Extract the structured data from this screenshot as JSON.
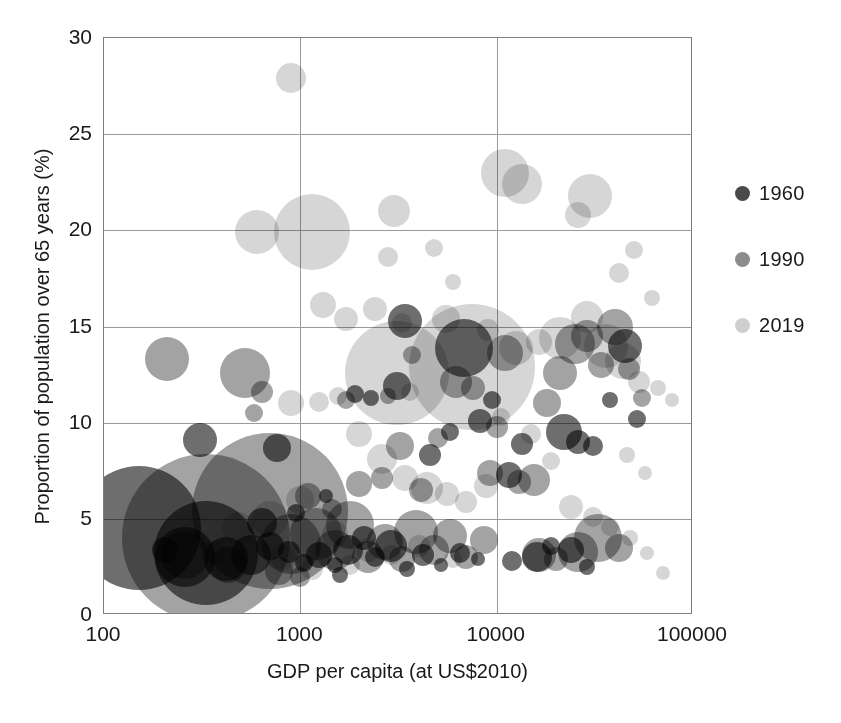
{
  "chart_data": {
    "type": "scatter",
    "title": "",
    "xlabel": "GDP per capita (at US$2010)",
    "ylabel": "Proportion of population over 65 years (%)",
    "xscale": "log",
    "yscale": "linear",
    "xlim": [
      100,
      100000
    ],
    "ylim": [
      0,
      30
    ],
    "xticks": [
      "100",
      "1000",
      "10000",
      "100000"
    ],
    "yticks": [
      "0",
      "5",
      "10",
      "15",
      "20",
      "25",
      "30"
    ],
    "grid": "both",
    "legend_position": "right",
    "legend": [
      {
        "name": "1960",
        "color": "#4a4a4a"
      },
      {
        "name": "1990",
        "color": "#8c8c8c"
      },
      {
        "name": "2019",
        "color": "#cfcfcf"
      }
    ],
    "size_encoding": "population",
    "series": [
      {
        "name": "1960",
        "color": "#4a4a4a",
        "points": [
          {
            "x": 150,
            "y": 4.5,
            "r": 62
          },
          {
            "x": 330,
            "y": 3.2,
            "r": 52
          },
          {
            "x": 260,
            "y": 3.0,
            "r": 30
          },
          {
            "x": 205,
            "y": 3.4,
            "r": 13
          },
          {
            "x": 420,
            "y": 2.9,
            "r": 22
          },
          {
            "x": 310,
            "y": 9.1,
            "r": 17
          },
          {
            "x": 560,
            "y": 3.1,
            "r": 20
          },
          {
            "x": 700,
            "y": 3.6,
            "r": 14
          },
          {
            "x": 880,
            "y": 3.3,
            "r": 11
          },
          {
            "x": 1050,
            "y": 2.7,
            "r": 9
          },
          {
            "x": 1250,
            "y": 3.1,
            "r": 13
          },
          {
            "x": 1500,
            "y": 2.6,
            "r": 8
          },
          {
            "x": 1750,
            "y": 3.4,
            "r": 15
          },
          {
            "x": 2100,
            "y": 4.0,
            "r": 12
          },
          {
            "x": 2400,
            "y": 3.0,
            "r": 10
          },
          {
            "x": 2900,
            "y": 3.6,
            "r": 16
          },
          {
            "x": 3500,
            "y": 2.4,
            "r": 8
          },
          {
            "x": 4200,
            "y": 3.1,
            "r": 11
          },
          {
            "x": 5200,
            "y": 2.6,
            "r": 7
          },
          {
            "x": 6500,
            "y": 3.2,
            "r": 10
          },
          {
            "x": 8000,
            "y": 2.9,
            "r": 7
          },
          {
            "x": 950,
            "y": 5.3,
            "r": 9
          },
          {
            "x": 1350,
            "y": 6.2,
            "r": 7
          },
          {
            "x": 1900,
            "y": 11.5,
            "r": 9
          },
          {
            "x": 2300,
            "y": 11.3,
            "r": 8
          },
          {
            "x": 3100,
            "y": 11.9,
            "r": 14
          },
          {
            "x": 3400,
            "y": 15.3,
            "r": 17
          },
          {
            "x": 4600,
            "y": 8.3,
            "r": 11
          },
          {
            "x": 5800,
            "y": 9.5,
            "r": 9
          },
          {
            "x": 6800,
            "y": 13.9,
            "r": 29
          },
          {
            "x": 8200,
            "y": 10.1,
            "r": 12
          },
          {
            "x": 9500,
            "y": 11.2,
            "r": 9
          },
          {
            "x": 11500,
            "y": 7.3,
            "r": 13
          },
          {
            "x": 13500,
            "y": 8.9,
            "r": 11
          },
          {
            "x": 16000,
            "y": 3.0,
            "r": 15
          },
          {
            "x": 19000,
            "y": 3.6,
            "r": 9
          },
          {
            "x": 22000,
            "y": 9.5,
            "r": 18
          },
          {
            "x": 26000,
            "y": 9.0,
            "r": 12
          },
          {
            "x": 31000,
            "y": 8.8,
            "r": 10
          },
          {
            "x": 38000,
            "y": 11.2,
            "r": 8
          },
          {
            "x": 45000,
            "y": 14.0,
            "r": 17
          },
          {
            "x": 52000,
            "y": 10.2,
            "r": 9
          },
          {
            "x": 760,
            "y": 8.7,
            "r": 14
          },
          {
            "x": 640,
            "y": 4.8,
            "r": 15
          },
          {
            "x": 1600,
            "y": 2.1,
            "r": 8
          },
          {
            "x": 12000,
            "y": 2.8,
            "r": 10
          },
          {
            "x": 24000,
            "y": 3.4,
            "r": 13
          },
          {
            "x": 29000,
            "y": 2.5,
            "r": 8
          }
        ]
      },
      {
        "name": "1990",
        "color": "#8c8c8c",
        "points": [
          {
            "x": 330,
            "y": 4.0,
            "r": 84
          },
          {
            "x": 700,
            "y": 5.4,
            "r": 78
          },
          {
            "x": 210,
            "y": 13.3,
            "r": 22
          },
          {
            "x": 260,
            "y": 3.1,
            "r": 24
          },
          {
            "x": 430,
            "y": 2.6,
            "r": 18
          },
          {
            "x": 520,
            "y": 12.6,
            "r": 25
          },
          {
            "x": 640,
            "y": 11.6,
            "r": 11
          },
          {
            "x": 580,
            "y": 10.5,
            "r": 9
          },
          {
            "x": 900,
            "y": 3.7,
            "r": 30
          },
          {
            "x": 1200,
            "y": 4.2,
            "r": 26
          },
          {
            "x": 1500,
            "y": 3.4,
            "r": 20
          },
          {
            "x": 1800,
            "y": 4.7,
            "r": 24
          },
          {
            "x": 2200,
            "y": 3.0,
            "r": 16
          },
          {
            "x": 2700,
            "y": 3.8,
            "r": 18
          },
          {
            "x": 3300,
            "y": 2.9,
            "r": 13
          },
          {
            "x": 3900,
            "y": 4.3,
            "r": 22
          },
          {
            "x": 4800,
            "y": 3.4,
            "r": 15
          },
          {
            "x": 5800,
            "y": 4.1,
            "r": 17
          },
          {
            "x": 7000,
            "y": 3.0,
            "r": 12
          },
          {
            "x": 8600,
            "y": 3.9,
            "r": 14
          },
          {
            "x": 1100,
            "y": 6.2,
            "r": 13
          },
          {
            "x": 1450,
            "y": 5.5,
            "r": 10
          },
          {
            "x": 2000,
            "y": 6.8,
            "r": 13
          },
          {
            "x": 2600,
            "y": 7.1,
            "r": 11
          },
          {
            "x": 3200,
            "y": 8.8,
            "r": 14
          },
          {
            "x": 4100,
            "y": 6.5,
            "r": 12
          },
          {
            "x": 5000,
            "y": 9.2,
            "r": 10
          },
          {
            "x": 6200,
            "y": 12.1,
            "r": 16
          },
          {
            "x": 7600,
            "y": 11.8,
            "r": 12
          },
          {
            "x": 9200,
            "y": 7.4,
            "r": 13
          },
          {
            "x": 11000,
            "y": 13.6,
            "r": 18
          },
          {
            "x": 13000,
            "y": 6.9,
            "r": 12
          },
          {
            "x": 15500,
            "y": 7.0,
            "r": 16
          },
          {
            "x": 18000,
            "y": 11.0,
            "r": 14
          },
          {
            "x": 21000,
            "y": 12.6,
            "r": 17
          },
          {
            "x": 25000,
            "y": 14.1,
            "r": 20
          },
          {
            "x": 29000,
            "y": 14.5,
            "r": 16
          },
          {
            "x": 34000,
            "y": 13.0,
            "r": 13
          },
          {
            "x": 40000,
            "y": 15.0,
            "r": 18
          },
          {
            "x": 47000,
            "y": 12.8,
            "r": 11
          },
          {
            "x": 55000,
            "y": 11.3,
            "r": 9
          },
          {
            "x": 1700,
            "y": 11.2,
            "r": 9
          },
          {
            "x": 2800,
            "y": 11.4,
            "r": 8
          },
          {
            "x": 780,
            "y": 2.3,
            "r": 14
          },
          {
            "x": 1000,
            "y": 2.0,
            "r": 10
          },
          {
            "x": 16500,
            "y": 3.1,
            "r": 17
          },
          {
            "x": 20000,
            "y": 2.9,
            "r": 12
          },
          {
            "x": 26000,
            "y": 3.3,
            "r": 20
          },
          {
            "x": 33000,
            "y": 4.0,
            "r": 24
          },
          {
            "x": 42000,
            "y": 3.5,
            "r": 14
          },
          {
            "x": 3700,
            "y": 13.5,
            "r": 9
          },
          {
            "x": 10000,
            "y": 9.8,
            "r": 11
          }
        ]
      },
      {
        "name": "2019",
        "color": "#cfcfcf",
        "points": [
          {
            "x": 900,
            "y": 27.9,
            "r": 15
          },
          {
            "x": 600,
            "y": 19.9,
            "r": 22
          },
          {
            "x": 1150,
            "y": 19.9,
            "r": 38
          },
          {
            "x": 3000,
            "y": 21.0,
            "r": 16
          },
          {
            "x": 11000,
            "y": 23.0,
            "r": 24
          },
          {
            "x": 13500,
            "y": 22.4,
            "r": 20
          },
          {
            "x": 30000,
            "y": 21.8,
            "r": 22
          },
          {
            "x": 26000,
            "y": 20.8,
            "r": 13
          },
          {
            "x": 2800,
            "y": 18.6,
            "r": 10
          },
          {
            "x": 4800,
            "y": 19.1,
            "r": 9
          },
          {
            "x": 50000,
            "y": 19.0,
            "r": 9
          },
          {
            "x": 62000,
            "y": 16.5,
            "r": 8
          },
          {
            "x": 42000,
            "y": 17.8,
            "r": 10
          },
          {
            "x": 6000,
            "y": 17.3,
            "r": 8
          },
          {
            "x": 1300,
            "y": 16.1,
            "r": 13
          },
          {
            "x": 1700,
            "y": 15.4,
            "r": 12
          },
          {
            "x": 2400,
            "y": 15.9,
            "r": 12
          },
          {
            "x": 3300,
            "y": 15.2,
            "r": 10
          },
          {
            "x": 5500,
            "y": 15.4,
            "r": 14
          },
          {
            "x": 7500,
            "y": 12.9,
            "r": 63
          },
          {
            "x": 3100,
            "y": 12.6,
            "r": 52
          },
          {
            "x": 9000,
            "y": 14.8,
            "r": 11
          },
          {
            "x": 12500,
            "y": 13.9,
            "r": 17
          },
          {
            "x": 16500,
            "y": 14.2,
            "r": 13
          },
          {
            "x": 21000,
            "y": 14.4,
            "r": 21
          },
          {
            "x": 29000,
            "y": 15.5,
            "r": 16
          },
          {
            "x": 36000,
            "y": 14.0,
            "r": 22
          },
          {
            "x": 44000,
            "y": 13.2,
            "r": 18
          },
          {
            "x": 53000,
            "y": 12.1,
            "r": 11
          },
          {
            "x": 66000,
            "y": 11.8,
            "r": 8
          },
          {
            "x": 78000,
            "y": 11.2,
            "r": 7
          },
          {
            "x": 900,
            "y": 11.0,
            "r": 13
          },
          {
            "x": 1250,
            "y": 11.1,
            "r": 10
          },
          {
            "x": 1550,
            "y": 11.4,
            "r": 9
          },
          {
            "x": 2000,
            "y": 9.4,
            "r": 13
          },
          {
            "x": 2600,
            "y": 8.1,
            "r": 15
          },
          {
            "x": 3400,
            "y": 7.1,
            "r": 13
          },
          {
            "x": 4400,
            "y": 6.6,
            "r": 16
          },
          {
            "x": 5600,
            "y": 6.3,
            "r": 12
          },
          {
            "x": 7000,
            "y": 5.9,
            "r": 11
          },
          {
            "x": 8800,
            "y": 6.7,
            "r": 12
          },
          {
            "x": 1000,
            "y": 6.0,
            "r": 14
          },
          {
            "x": 700,
            "y": 5.0,
            "r": 18
          },
          {
            "x": 480,
            "y": 4.5,
            "r": 16
          },
          {
            "x": 1500,
            "y": 4.2,
            "r": 13
          },
          {
            "x": 2200,
            "y": 3.4,
            "r": 12
          },
          {
            "x": 2900,
            "y": 3.1,
            "r": 10
          },
          {
            "x": 4000,
            "y": 3.6,
            "r": 11
          },
          {
            "x": 6000,
            "y": 2.9,
            "r": 9
          },
          {
            "x": 1800,
            "y": 2.6,
            "r": 10
          },
          {
            "x": 1150,
            "y": 2.4,
            "r": 11
          },
          {
            "x": 820,
            "y": 3.0,
            "r": 13
          },
          {
            "x": 15000,
            "y": 9.4,
            "r": 10
          },
          {
            "x": 19000,
            "y": 8.0,
            "r": 9
          },
          {
            "x": 24000,
            "y": 5.6,
            "r": 12
          },
          {
            "x": 31000,
            "y": 5.1,
            "r": 10
          },
          {
            "x": 38000,
            "y": 4.6,
            "r": 9
          },
          {
            "x": 48000,
            "y": 4.0,
            "r": 8
          },
          {
            "x": 58000,
            "y": 3.2,
            "r": 7
          },
          {
            "x": 70000,
            "y": 2.2,
            "r": 7
          },
          {
            "x": 10500,
            "y": 10.3,
            "r": 9
          },
          {
            "x": 360,
            "y": 3.2,
            "r": 12
          },
          {
            "x": 3600,
            "y": 11.6,
            "r": 9
          },
          {
            "x": 46000,
            "y": 8.3,
            "r": 8
          },
          {
            "x": 57000,
            "y": 7.4,
            "r": 7
          }
        ]
      }
    ]
  },
  "axes": {
    "x_title": "GDP per capita (at US$2010)",
    "y_title": "Proportion of population over 65 years (%)"
  }
}
